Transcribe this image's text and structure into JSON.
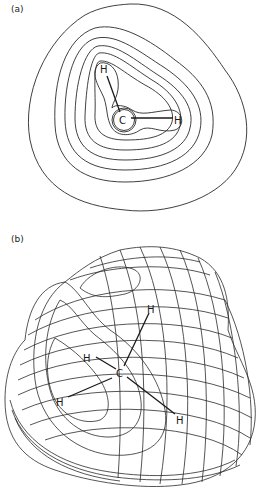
{
  "figure": {
    "panel_a": {
      "label": "(a)",
      "type": "2D contour plot",
      "atoms": [
        {
          "symbol": "H",
          "x": 104,
          "y": 71
        },
        {
          "symbol": "C",
          "x": 123,
          "y": 122
        },
        {
          "symbol": "H",
          "x": 178,
          "y": 122
        }
      ],
      "contour_count": 8
    },
    "panel_b": {
      "label": "(b)",
      "type": "3D wireframe surface",
      "atoms": [
        {
          "symbol": "C",
          "x": 120,
          "y": 375
        },
        {
          "symbol": "H",
          "x": 151,
          "y": 311
        },
        {
          "symbol": "H",
          "x": 87,
          "y": 360
        },
        {
          "symbol": "H",
          "x": 60,
          "y": 404
        },
        {
          "symbol": "H",
          "x": 180,
          "y": 422
        }
      ]
    }
  },
  "colors": {
    "line": "#2a2a2a",
    "background": "#ffffff"
  }
}
